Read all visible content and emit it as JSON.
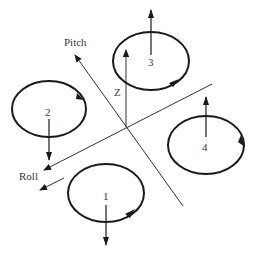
{
  "diagram": {
    "axes": {
      "pitch": {
        "label": "Pitch"
      },
      "roll": {
        "label": "Roll"
      },
      "z": {
        "label": "Z"
      }
    },
    "rotors": [
      {
        "id": "1",
        "label": "1",
        "thrust_direction": "down",
        "rotation": "counterclockwise"
      },
      {
        "id": "2",
        "label": "2",
        "thrust_direction": "down",
        "rotation": "clockwise"
      },
      {
        "id": "3",
        "label": "3",
        "thrust_direction": "up",
        "rotation": "counterclockwise"
      },
      {
        "id": "4",
        "label": "4",
        "thrust_direction": "up",
        "rotation": "clockwise"
      }
    ],
    "colors": {
      "line": "#1a1a1a",
      "axis": "#333333",
      "text": "#3a3a3a",
      "background": "#ffffff"
    }
  }
}
